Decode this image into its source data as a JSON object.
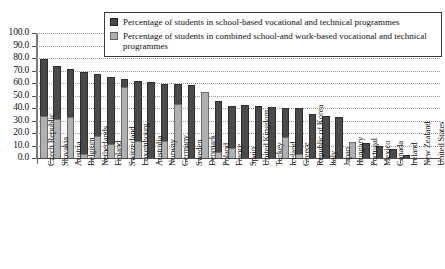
{
  "chart_data": {
    "type": "bar",
    "stacked": true,
    "title": "",
    "subtitle": "",
    "xlabel": "",
    "ylabel": "",
    "ylim": [
      0.0,
      100.0
    ],
    "ytick_step": 10.0,
    "ytick_labels": [
      "0.0",
      "10.0",
      "20.0",
      "30.0",
      "40.0",
      "50.0",
      "60.0",
      "70.0",
      "80.0",
      "90.0",
      "100.0"
    ],
    "grid": "horizontal-dotted",
    "legend_position": "top-center",
    "categories": [
      "Czech Republic",
      "Slovakia",
      "Austria",
      "Belgium",
      "Netherlands",
      "Finland",
      "Switzerland",
      "Luxembourg",
      "Australia",
      "Norway",
      "Germany",
      "Sweden",
      "Denmark",
      "Poland",
      "France",
      "Spain",
      "United Kingdom",
      "Turkey",
      "Iceland",
      "Greece",
      "Republic of Korea",
      "Italy",
      "Japan",
      "Hungary",
      "Portugal",
      "Mexico",
      "Canada",
      "Ireland",
      "New Zealand",
      "United States"
    ],
    "series": [
      {
        "name": "Percentage of students in combined school-and work-based vocational and technical programmes",
        "color": "#b0b0b0",
        "values": [
          34.0,
          31.0,
          32.5,
          3.5,
          17.5,
          11.0,
          57.0,
          13.5,
          0.0,
          13.5,
          43.0,
          0.0,
          53.0,
          5.0,
          8.0,
          0.0,
          0.0,
          0.0,
          17.0,
          3.0,
          0.0,
          0.0,
          0.0,
          13.0,
          0.0,
          0.0,
          0.0,
          0.0,
          0.0,
          0.0
        ]
      },
      {
        "name": "Percentage of students in school-based vocational and technical programmes",
        "color": "#4a4a4a",
        "values": [
          45.0,
          42.5,
          39.0,
          65.5,
          49.5,
          54.0,
          6.5,
          48.5,
          61.0,
          45.5,
          16.0,
          58.5,
          0.0,
          41.0,
          33.5,
          42.5,
          41.5,
          41.0,
          23.0,
          37.0,
          35.0,
          34.0,
          32.5,
          0.0,
          12.0,
          10.0,
          7.0,
          2.5,
          0.0,
          0.0
        ]
      }
    ],
    "totals": [
      79.0,
      73.5,
      71.5,
      69.0,
      67.0,
      65.0,
      63.5,
      62.0,
      61.0,
      59.0,
      59.0,
      58.5,
      53.0,
      46.0,
      41.5,
      42.5,
      41.5,
      41.0,
      40.0,
      40.0,
      35.0,
      34.0,
      32.5,
      13.0,
      12.0,
      10.0,
      7.0,
      2.5,
      0.0,
      0.0
    ]
  },
  "legend": {
    "items": [
      {
        "label": "Percentage of students in school-based vocational and technical programmes",
        "swatch": "school"
      },
      {
        "label": "Percentage of students in combined school-and work-based vocational and technical programmes",
        "swatch": "combined"
      }
    ]
  }
}
